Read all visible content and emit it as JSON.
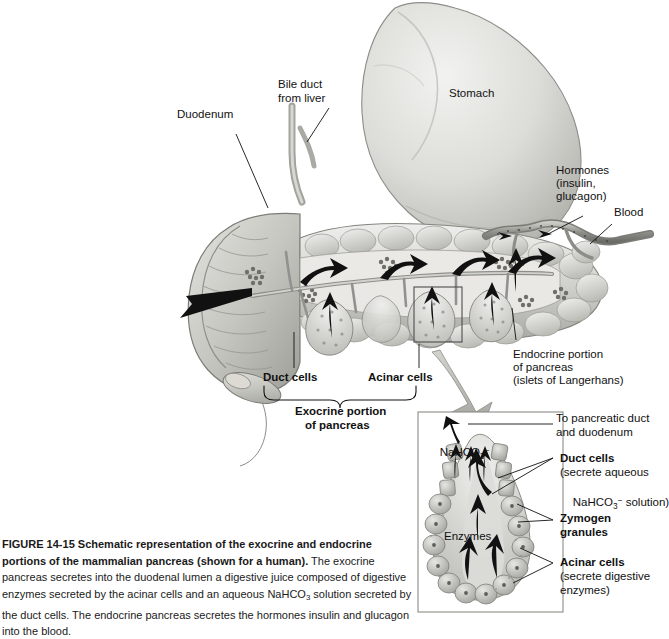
{
  "figure": {
    "number": "FIGURE 14-15",
    "title": "Schematic representation of the exocrine and endocrine portions of the mammalian pancreas (shown for a human).",
    "caption_body": "The exocrine pancreas secretes into the duodenal lumen a digestive juice composed of digestive enzymes secreted by the acinar cells and an aqueous NaHCO3 solution secreted by the duct cells. The endocrine pancreas secretes the hormones insulin and glucagon into the blood.",
    "caption_part1": "The exocrine pancreas secretes into the",
    "caption_part2": "duodenal lumen a digestive juice composed of digestive enzymes secreted by the acinar",
    "caption_part3a": "cells and an aqueous NaHCO",
    "caption_part3b": "3",
    "caption_part3c": " solution secreted by the duct cells. The endocrine pancreas",
    "caption_part4": "secretes the hormones insulin and glucagon into the blood."
  },
  "main_diagram": {
    "labels": {
      "duodenum": "Duodenum",
      "bile_duct_line1": "Bile duct",
      "bile_duct_line2": "from liver",
      "stomach": "Stomach",
      "hormones_line1": "Hormones",
      "hormones_line2": "(insulin,",
      "hormones_line3": "glucagon)",
      "blood": "Blood",
      "duct_cells": "Duct cells",
      "acinar_cells": "Acinar cells",
      "exocrine_line1": "Exocrine portion",
      "exocrine_line2": "of pancreas",
      "endocrine_line1": "Endocrine portion",
      "endocrine_line2": "of pancreas",
      "endocrine_line3": "(islets of Langerhans)"
    }
  },
  "inset": {
    "internal_labels": {
      "nahco3_text": "NaHCO",
      "nahco3_sub": "3",
      "nahco3_sup": "−",
      "enzymes": "Enzymes"
    },
    "callouts": {
      "to_duct_line1": "To pancreatic duct",
      "to_duct_line2": "and duodenum",
      "duct_cells_line1": "Duct cells",
      "duct_cells_line2": "(secrete aqueous",
      "duct_cells_line3a": "NaHCO",
      "duct_cells_line3b": "3",
      "duct_cells_line3c": "−",
      "duct_cells_line3d": " solution)",
      "zymogen_line1": "Zymogen",
      "zymogen_line2": "granules",
      "acinar_line1": "Acinar cells",
      "acinar_line2": "(secrete digestive",
      "acinar_line3": "enzymes)"
    }
  },
  "colors": {
    "organ_light": "#e8e8e6",
    "organ_mid": "#cfcfcb",
    "organ_dark": "#9d9d98",
    "outline": "#6f6f6b",
    "text": "#111111",
    "leader": "#1a1a1a",
    "inset_border": "#8a8a86"
  }
}
